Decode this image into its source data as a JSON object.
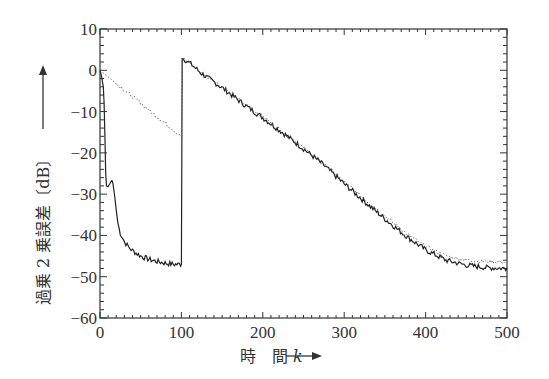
{
  "chart_data": {
    "type": "line",
    "title": "",
    "xlabel": "時　間 k",
    "ylabel": "過乗 2 乗誤差〔dB〕",
    "xlim": [
      0,
      500
    ],
    "ylim": [
      -60,
      10
    ],
    "x_ticks": [
      0,
      100,
      200,
      300,
      400,
      500
    ],
    "y_ticks": [
      10,
      0,
      -10,
      -20,
      -30,
      -40,
      -50,
      -60
    ],
    "y_tick_labels": [
      "10",
      "0",
      "−10",
      "−20",
      "−30",
      "−40",
      "−50",
      "−60"
    ],
    "grid": false,
    "legend": null,
    "series": [
      {
        "name": "solid",
        "style": "solid",
        "x": [
          0,
          2,
          4,
          5,
          6,
          7,
          8,
          10,
          12,
          14,
          15,
          16,
          18,
          20,
          22,
          25,
          30,
          35,
          40,
          50,
          60,
          70,
          80,
          90,
          99,
          100,
          101,
          110,
          125,
          150,
          175,
          200,
          225,
          250,
          275,
          300,
          325,
          350,
          375,
          400,
          425,
          450,
          475,
          500
        ],
        "y": [
          0,
          -1.5,
          -4,
          -8,
          -16,
          -25,
          -28,
          -28.2,
          -27.5,
          -26.8,
          -26.8,
          -27.5,
          -30.5,
          -34,
          -37,
          -39.5,
          -41.5,
          -42.8,
          -43.7,
          -45,
          -45.8,
          -46.3,
          -46.7,
          -47,
          -47,
          -47,
          3,
          1.8,
          -0.8,
          -4.2,
          -8,
          -11.5,
          -15.2,
          -19,
          -23,
          -27.5,
          -31.8,
          -36,
          -40,
          -43.5,
          -46,
          -47.2,
          -47.8,
          -48
        ]
      },
      {
        "name": "dotted",
        "style": "dotted",
        "x": [
          0,
          25,
          50,
          75,
          100,
          101,
          125,
          150,
          175,
          200,
          225,
          250,
          275,
          300,
          325,
          350,
          375,
          400,
          425,
          450,
          475,
          500
        ],
        "y": [
          0,
          -4,
          -8,
          -12,
          -16,
          3,
          -0.6,
          -4,
          -7.8,
          -11.2,
          -15,
          -18.8,
          -22.7,
          -27,
          -31.2,
          -35.3,
          -39.3,
          -42.7,
          -45,
          -46,
          -46.3,
          -46.5
        ]
      }
    ]
  },
  "axis": {
    "x_arrow": "→",
    "y_arrow": "→"
  }
}
